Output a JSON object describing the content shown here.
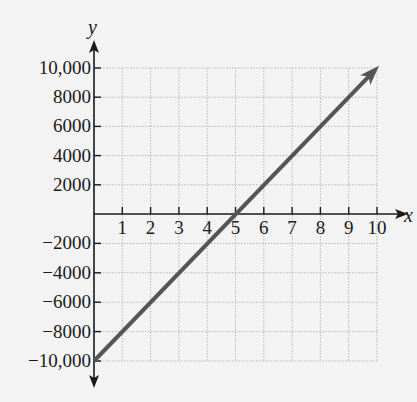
{
  "chart_data": {
    "type": "line",
    "title": "",
    "xlabel": "x",
    "ylabel": "y",
    "xlim": [
      0,
      10
    ],
    "ylim": [
      -10000,
      10000
    ],
    "grid": true,
    "x_ticks": [
      "1",
      "2",
      "3",
      "4",
      "5",
      "6",
      "7",
      "8",
      "9",
      "10"
    ],
    "y_ticks": [
      "10,000",
      "8000",
      "6000",
      "4000",
      "2000",
      "-2000",
      "-4000",
      "-6000",
      "-8000",
      "-10,000"
    ],
    "series": [
      {
        "name": "line",
        "x": [
          0,
          5,
          10
        ],
        "values": [
          -10000,
          0,
          10000
        ],
        "color": "#555555",
        "arrow_end": true
      }
    ],
    "legend": null
  },
  "labels": {
    "x_axis": "x",
    "y_axis": "y",
    "x_ticks": [
      "1",
      "2",
      "3",
      "4",
      "5",
      "6",
      "7",
      "8",
      "9",
      "10"
    ],
    "y_ticks": [
      {
        "v": 10000,
        "t": "10,000"
      },
      {
        "v": 8000,
        "t": "8000"
      },
      {
        "v": 6000,
        "t": "6000"
      },
      {
        "v": 4000,
        "t": "4000"
      },
      {
        "v": 2000,
        "t": "2000"
      },
      {
        "v": -2000,
        "t": "−2000"
      },
      {
        "v": -4000,
        "t": "−4000"
      },
      {
        "v": -6000,
        "t": "−6000"
      },
      {
        "v": -8000,
        "t": "−8000"
      },
      {
        "v": -10000,
        "t": "−10,000"
      }
    ]
  },
  "colors": {
    "axis": "#1a1a1a",
    "grid": "#b8b8b8",
    "line": "#555555",
    "background": "#f3f3f3"
  }
}
